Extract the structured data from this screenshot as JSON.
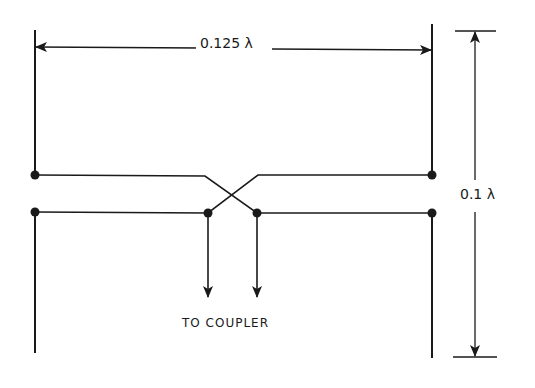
{
  "diagram": {
    "type": "crossed-feed dipole pair (phasing line transposition)",
    "colors": {
      "line": "#1a1a1a",
      "background": "#ffffff"
    },
    "dimensions": {
      "width_label": "0.125 λ",
      "height_label": "0.1 λ"
    },
    "feed": {
      "label": "TO COUPLER"
    }
  }
}
